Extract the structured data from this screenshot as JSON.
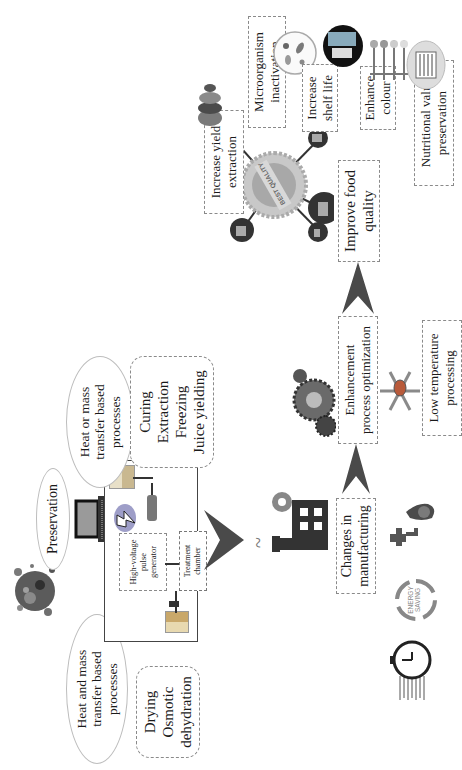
{
  "diagram": {
    "orientation": "rotated 90 degrees counter-clockwise",
    "left_section": {
      "heat_and_mass": {
        "label": "Heat and mass transfer based processes",
        "line1": "Heat and mass",
        "line2": "transfer based",
        "line3": "processes"
      },
      "heat_and_mass_examples": {
        "items": [
          "Drying",
          "Osmotic",
          "dehydration"
        ]
      },
      "preservation": {
        "label": "Preservation"
      },
      "heat_or_mass": {
        "label": "Heat or mass transfer based processes",
        "line1": "Heat or mass",
        "line2": "transfer based",
        "line3": "processes"
      },
      "heat_or_mass_examples": {
        "items": [
          "Curing",
          "Extraction",
          "Freezing",
          "Juice yielding"
        ]
      },
      "pef_system": {
        "generator_label": [
          "High-voltage",
          "pulse",
          "generator"
        ],
        "chamber_label": [
          "Treatment",
          "chamber"
        ]
      }
    },
    "middle_section": {
      "changes": {
        "line1": "Changes in",
        "line2": "manufacturing"
      },
      "energy_icon_text": [
        "ENERGY",
        "SAVING"
      ],
      "enhancement": {
        "line1": "Enhancement",
        "line2": "process optimization"
      },
      "low_temp": {
        "line1": "Low temperature",
        "line2": "processing"
      }
    },
    "right_section": {
      "improve": {
        "line1": "Improve food",
        "line2": "quality"
      },
      "badge_text": "BEST QUALITY",
      "increase_yield": {
        "line1": "Increase yield",
        "line2": "extraction"
      },
      "microorganism": {
        "line1": "Microorganism",
        "line2": "inactivation"
      },
      "shelf_life": {
        "line1": "Increase",
        "line2": "shelf life"
      },
      "enhance_colour": {
        "line1": "Enhance",
        "line2": "colour"
      },
      "nutritional": {
        "line1": "Nutritional value",
        "line2": "preservation"
      }
    },
    "colors": {
      "arrow": "#4a4a4a",
      "dark_icon": "#333333",
      "dashed_border": "#8a8a8a",
      "ellipse_border": "#bdbdbd",
      "gray_badge": "#b0b0b0"
    }
  }
}
